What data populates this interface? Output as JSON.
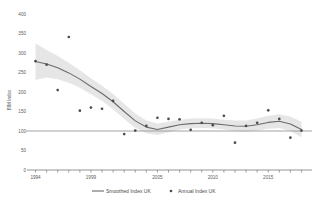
{
  "chart_data": {
    "type": "line",
    "title": "",
    "xlabel": "",
    "ylabel": "BIM Index",
    "ylim": [
      0,
      400
    ],
    "xlim": [
      1993.5,
      2018.5
    ],
    "grid": false,
    "legend_position": "bottom",
    "y_ticks": [
      400,
      350,
      300,
      250,
      200,
      150,
      100,
      50,
      0
    ],
    "y_tick_labels": [
      "400",
      "350",
      "300",
      "250",
      "200",
      "150",
      "100",
      "50",
      "0"
    ],
    "x_tick_labels": [
      "1994",
      "1999",
      "2005",
      "2010",
      "2015"
    ],
    "x_tick_label_years": [
      1994,
      1999,
      2005,
      2010,
      2015
    ],
    "x_minor_tick_years": [
      1994,
      1995,
      1996,
      1997,
      1998,
      1999,
      2000,
      2001,
      2002,
      2003,
      2004,
      2005,
      2006,
      2007,
      2008,
      2009,
      2010,
      2011,
      2012,
      2013,
      2014,
      2015,
      2016,
      2017,
      2018
    ],
    "reference_line_y": 100,
    "series": [
      {
        "name": "Smoothed Index UK",
        "marker": "line",
        "color": "#6b6b6b",
        "x": [
          1994,
          1995,
          1996,
          1997,
          1998,
          1999,
          2000,
          2001,
          2002,
          2003,
          2004,
          2005,
          2006,
          2007,
          2008,
          2009,
          2010,
          2011,
          2012,
          2013,
          2014,
          2015,
          2016,
          2017,
          2018
        ],
        "values": [
          278,
          272,
          262,
          249,
          233,
          214,
          196,
          175,
          150,
          126,
          110,
          104,
          110,
          116,
          119,
          120,
          119,
          116,
          113,
          112,
          116,
          122,
          125,
          118,
          104
        ]
      },
      {
        "name": "Annual Index UK",
        "marker": "point",
        "color": "#4d4d4d",
        "x": [
          1994,
          1995,
          1996,
          1997,
          1998,
          1999,
          2000,
          2001,
          2002,
          2003,
          2004,
          2005,
          2006,
          2007,
          2008,
          2009,
          2010,
          2011,
          2012,
          2013,
          2014,
          2015,
          2016,
          2017,
          2018
        ],
        "values": [
          279,
          270,
          205,
          341,
          152,
          160,
          157,
          177,
          92,
          101,
          113,
          134,
          131,
          130,
          103,
          121,
          115,
          139,
          70,
          113,
          121,
          153,
          131,
          83,
          101
        ]
      }
    ],
    "confidence_band": {
      "name": "Smoothed Index UK 95% band",
      "color": "#e2e2e2",
      "x": [
        1994,
        1995,
        1996,
        1997,
        1998,
        1999,
        2000,
        2001,
        2002,
        2003,
        2004,
        2005,
        2006,
        2007,
        2008,
        2009,
        2010,
        2011,
        2012,
        2013,
        2014,
        2015,
        2016,
        2017,
        2018
      ],
      "lower": [
        231,
        237,
        233,
        224,
        211,
        194,
        177,
        156,
        131,
        108,
        94,
        90,
        97,
        104,
        107,
        108,
        107,
        104,
        100,
        98,
        101,
        106,
        108,
        100,
        84
      ],
      "upper": [
        325,
        308,
        292,
        275,
        256,
        235,
        216,
        195,
        170,
        145,
        127,
        119,
        124,
        129,
        132,
        133,
        132,
        129,
        127,
        127,
        132,
        139,
        143,
        137,
        124
      ]
    }
  },
  "legend": {
    "items": [
      {
        "label": "Smoothed Index UK",
        "marker": "line"
      },
      {
        "label": "Annual Index UK",
        "marker": "point"
      }
    ]
  },
  "colors": {
    "line": "#6b6b6b",
    "point": "#4d4d4d",
    "band": "#e2e2e2",
    "axis": "#7a7a7a",
    "text": "#5a5a5a",
    "background": "#ffffff"
  }
}
